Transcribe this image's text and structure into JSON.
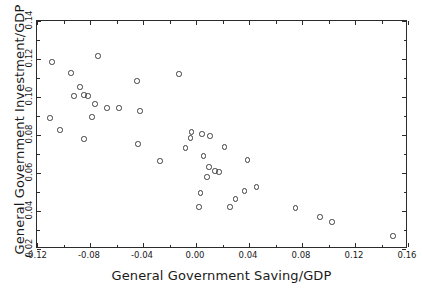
{
  "chart_data": {
    "type": "scatter",
    "title": "",
    "xlabel": "General Government Saving/GDP",
    "ylabel": "General Government Investment/GDP",
    "xlim": [
      -0.12,
      0.16
    ],
    "ylim": [
      0.02,
      0.14
    ],
    "xticks": [
      -0.12,
      -0.08,
      -0.04,
      0.0,
      0.04,
      0.08,
      0.12,
      0.16
    ],
    "xtick_labels": [
      "-0.12",
      "-0.08",
      "-0.04",
      "0.00",
      "0.04",
      "0.08",
      "0.12",
      "0.16"
    ],
    "yticks": [
      0.02,
      0.04,
      0.06,
      0.08,
      0.1,
      0.12,
      0.14
    ],
    "ytick_labels": [
      "0.02",
      "0.04",
      "0.06",
      "0.08",
      "0.10",
      "0.12",
      "0.14"
    ],
    "grid": false,
    "legend": null,
    "marker": "open-circle",
    "marker_color": "#3d3d3d",
    "frame_color": "#2b2b2b",
    "background": "#ffffff",
    "n_points": 41,
    "points": [
      {
        "x": -0.1087,
        "y": 0.1184
      },
      {
        "x": -0.0943,
        "y": 0.1126
      },
      {
        "x": -0.0875,
        "y": 0.1053
      },
      {
        "x": -0.0845,
        "y": 0.1011
      },
      {
        "x": -0.0815,
        "y": 0.1005
      },
      {
        "x": -0.0762,
        "y": 0.0963
      },
      {
        "x": -0.0739,
        "y": 0.1216
      },
      {
        "x": -0.1102,
        "y": 0.0889
      },
      {
        "x": -0.1026,
        "y": 0.0826
      },
      {
        "x": -0.0784,
        "y": 0.0895
      },
      {
        "x": -0.0845,
        "y": 0.0779
      },
      {
        "x": -0.0581,
        "y": 0.0942
      },
      {
        "x": -0.0445,
        "y": 0.1084
      },
      {
        "x": -0.0422,
        "y": 0.0926
      },
      {
        "x": -0.0437,
        "y": 0.0753
      },
      {
        "x": -0.0271,
        "y": 0.0663
      },
      {
        "x": -0.0129,
        "y": 0.1121
      },
      {
        "x": -0.0035,
        "y": 0.0816
      },
      {
        "x": -0.0043,
        "y": 0.0784
      },
      {
        "x": -0.0081,
        "y": 0.0732
      },
      {
        "x": 0.0046,
        "y": 0.0805
      },
      {
        "x": 0.0105,
        "y": 0.0795
      },
      {
        "x": 0.0058,
        "y": 0.0689
      },
      {
        "x": 0.0216,
        "y": 0.0737
      },
      {
        "x": 0.0098,
        "y": 0.0632
      },
      {
        "x": 0.0144,
        "y": 0.0611
      },
      {
        "x": 0.0083,
        "y": 0.0579
      },
      {
        "x": 0.0034,
        "y": 0.0495
      },
      {
        "x": 0.0022,
        "y": 0.0421
      },
      {
        "x": 0.0257,
        "y": 0.0421
      },
      {
        "x": 0.0299,
        "y": 0.0463
      },
      {
        "x": 0.0367,
        "y": 0.0505
      },
      {
        "x": 0.039,
        "y": 0.0668
      },
      {
        "x": 0.0458,
        "y": 0.0526
      },
      {
        "x": 0.0752,
        "y": 0.0416
      },
      {
        "x": 0.0935,
        "y": 0.0368
      },
      {
        "x": 0.1025,
        "y": 0.0342
      },
      {
        "x": 0.1487,
        "y": 0.0268
      },
      {
        "x": -0.0671,
        "y": 0.0942
      },
      {
        "x": -0.092,
        "y": 0.1005
      },
      {
        "x": 0.0173,
        "y": 0.0605
      }
    ]
  }
}
